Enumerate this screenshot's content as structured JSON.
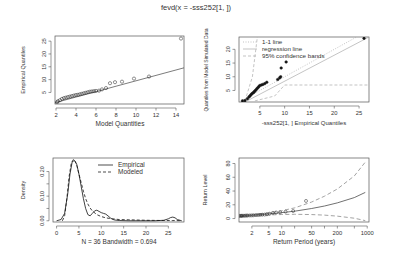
{
  "figure": {
    "title": "fevd(x = -sss252[1, ])",
    "width": 393,
    "height": 263
  },
  "chart_data": [
    {
      "id": "qq-model",
      "type": "scatter",
      "title": "",
      "xlabel": "Model Quantities",
      "ylabel": "Empirical Quantiles",
      "xlim": [
        1.9,
        14.8
      ],
      "ylim": [
        0.5,
        27
      ],
      "xticks": [
        2,
        4,
        6,
        8,
        10,
        12,
        14
      ],
      "yticks": [
        5,
        10,
        15,
        20,
        25
      ],
      "grid": false,
      "box": {
        "x0": 55,
        "y0": 36,
        "x1": 184,
        "y1": 104
      },
      "points": [
        [
          2.1,
          1.2
        ],
        [
          2.2,
          1.6
        ],
        [
          2.4,
          2.0
        ],
        [
          2.6,
          2.5
        ],
        [
          2.8,
          2.8
        ],
        [
          3.0,
          3.0
        ],
        [
          3.2,
          3.2
        ],
        [
          3.4,
          3.4
        ],
        [
          3.6,
          3.6
        ],
        [
          3.8,
          3.8
        ],
        [
          4.0,
          4.0
        ],
        [
          4.2,
          4.1
        ],
        [
          4.4,
          4.3
        ],
        [
          4.6,
          4.5
        ],
        [
          4.8,
          4.7
        ],
        [
          5.0,
          4.9
        ],
        [
          5.2,
          5.1
        ],
        [
          5.4,
          5.3
        ],
        [
          5.6,
          5.4
        ],
        [
          5.8,
          5.5
        ],
        [
          6.0,
          5.6
        ],
        [
          6.3,
          5.7
        ],
        [
          6.6,
          6.2
        ],
        [
          7.0,
          6.7
        ],
        [
          7.4,
          8.6
        ],
        [
          7.9,
          9.0
        ],
        [
          8.6,
          9.2
        ],
        [
          9.8,
          10.4
        ],
        [
          11.3,
          11.2
        ],
        [
          14.5,
          26.0
        ]
      ],
      "fit_line": {
        "x": [
          1.9,
          14.8
        ],
        "y": [
          1.0,
          14.6
        ]
      }
    },
    {
      "id": "qq-simulated",
      "type": "scatter",
      "xlabel": "-sss252[1, ] Empirical Quantiles",
      "ylabel": "Quantiles from Model Simulated Data",
      "xlim": [
        0.8,
        27
      ],
      "ylim": [
        0.8,
        24.5
      ],
      "xticks": [
        5,
        10,
        15,
        20,
        25
      ],
      "yticks": [
        5,
        10,
        15,
        20
      ],
      "grid": false,
      "box": {
        "x0": 239,
        "y0": 37,
        "x1": 369,
        "y1": 102
      },
      "legend": {
        "position": "topleft",
        "entries": [
          {
            "label": "1-1 line",
            "style": "dotted",
            "color": "#aaaaaa"
          },
          {
            "label": "regression line",
            "style": "solid",
            "color": "#aaaaaa"
          },
          {
            "label": "95% confidence bands",
            "style": "dashed",
            "color": "#aaaaaa"
          }
        ]
      },
      "points": [
        [
          1.5,
          1.2
        ],
        [
          2.0,
          1.3
        ],
        [
          2.5,
          2.0
        ],
        [
          2.8,
          2.6
        ],
        [
          3.0,
          3.0
        ],
        [
          3.2,
          3.4
        ],
        [
          3.4,
          3.8
        ],
        [
          3.6,
          4.1
        ],
        [
          3.8,
          4.4
        ],
        [
          4.0,
          4.8
        ],
        [
          4.2,
          5.2
        ],
        [
          4.4,
          5.6
        ],
        [
          4.6,
          6.0
        ],
        [
          4.8,
          6.4
        ],
        [
          5.0,
          6.8
        ],
        [
          5.3,
          7.0
        ],
        [
          5.6,
          7.2
        ],
        [
          6.0,
          7.5
        ],
        [
          6.4,
          8.0
        ],
        [
          8.6,
          9.0
        ],
        [
          9.0,
          9.6
        ],
        [
          9.2,
          10.0
        ],
        [
          9.3,
          13.2
        ],
        [
          10.3,
          15.4
        ],
        [
          26.0,
          24.0
        ]
      ],
      "one_to_one": {
        "x": [
          0.8,
          24.5
        ],
        "y": [
          0.8,
          24.5
        ]
      },
      "regression": {
        "x": [
          2.0,
          27
        ],
        "y": [
          0.8,
          24.5
        ]
      },
      "band_lower": {
        "x": [
          4.0,
          8.0,
          10.0,
          27
        ],
        "y": [
          1.2,
          3.0,
          7.0,
          7.0
        ]
      },
      "band_upper": {
        "x": [
          2.0,
          3.5,
          4.5
        ],
        "y": [
          1.2,
          10.0,
          24.5
        ]
      }
    },
    {
      "id": "density",
      "type": "line",
      "xlabel": "N = 36   Bandwidth = 0.694",
      "ylabel": "Density",
      "xlim": [
        -0.8,
        28.5
      ],
      "ylim": [
        -0.005,
        0.255
      ],
      "xticks": [
        0,
        5,
        10,
        15,
        20,
        25
      ],
      "yticks": [
        0.0,
        0.05,
        0.1,
        0.15,
        0.2
      ],
      "ytick_labels": [
        "0.00",
        "",
        "0.10",
        "",
        "0.20"
      ],
      "grid": false,
      "box": {
        "x0": 53,
        "y0": 158,
        "x1": 184,
        "y1": 222
      },
      "legend": {
        "position": "topright",
        "entries": [
          {
            "label": "Empirical",
            "style": "solid",
            "color": "#000000"
          },
          {
            "label": "Modeled",
            "style": "dashed",
            "color": "#000000"
          }
        ]
      },
      "series": [
        {
          "name": "Empirical",
          "style": "solid",
          "x": [
            0,
            1,
            1.8,
            2.5,
            3.0,
            3.5,
            4.0,
            4.5,
            5.0,
            5.5,
            6.0,
            6.5,
            7.0,
            7.5,
            8.0,
            8.5,
            9.0,
            9.5,
            10.0,
            10.5,
            11.0,
            11.5,
            12.0,
            12.5,
            13.0,
            14,
            16,
            18,
            20,
            22,
            24,
            25,
            25.5,
            26,
            26.5,
            27,
            28
          ],
          "y": [
            0.0,
            0.005,
            0.03,
            0.11,
            0.19,
            0.24,
            0.245,
            0.23,
            0.19,
            0.14,
            0.09,
            0.05,
            0.025,
            0.02,
            0.03,
            0.04,
            0.043,
            0.038,
            0.033,
            0.03,
            0.027,
            0.02,
            0.012,
            0.006,
            0.003,
            0.001,
            0.0,
            0.0,
            0.0,
            0.0,
            0.002,
            0.008,
            0.013,
            0.015,
            0.012,
            0.005,
            0.0
          ]
        },
        {
          "name": "Modeled",
          "style": "dashed",
          "x": [
            1.3,
            1.8,
            2.3,
            2.8,
            3.3,
            3.8,
            4.2,
            4.6,
            5.0,
            5.5,
            6.0,
            6.5,
            7.0,
            7.5,
            8.0,
            9.0,
            10.0,
            11.0,
            12.0,
            13.0,
            14.0,
            16.0,
            18.0,
            20.0,
            22.0,
            24.0,
            26.0,
            28.0
          ],
          "y": [
            0.0,
            0.02,
            0.09,
            0.18,
            0.235,
            0.25,
            0.24,
            0.22,
            0.19,
            0.155,
            0.12,
            0.09,
            0.068,
            0.052,
            0.04,
            0.025,
            0.017,
            0.012,
            0.009,
            0.007,
            0.005,
            0.004,
            0.003,
            0.002,
            0.0015,
            0.001,
            0.0008,
            0.0005
          ]
        }
      ]
    },
    {
      "id": "return-level",
      "type": "line",
      "xlabel": "Return Period (years)",
      "ylabel": "Return Level",
      "xscale": "log",
      "xlim": [
        1.0,
        1100
      ],
      "ylim": [
        -5,
        88
      ],
      "xticks": [
        2,
        5,
        10,
        20,
        50,
        100,
        200,
        500,
        1000
      ],
      "xtick_labels": [
        "2",
        "5",
        "10",
        "",
        "50",
        "",
        "200",
        "",
        "1000"
      ],
      "yticks": [
        0,
        20,
        40,
        60,
        80
      ],
      "grid": false,
      "box": {
        "x0": 239,
        "y0": 158,
        "x1": 369,
        "y1": 222
      },
      "series": [
        {
          "name": "Return level estimate",
          "style": "solid",
          "x": [
            1.05,
            1.5,
            2,
            3,
            5,
            10,
            20,
            50,
            100,
            200,
            500,
            900
          ],
          "y": [
            3.5,
            4.2,
            4.8,
            5.6,
            6.8,
            8.6,
            10.7,
            14.6,
            18.2,
            22.8,
            30.5,
            38.0
          ]
        },
        {
          "name": "Upper 95% CI",
          "style": "dashed",
          "x": [
            1.05,
            2,
            5,
            10,
            20,
            50,
            100,
            200,
            500,
            900
          ],
          "y": [
            4.0,
            5.5,
            8.2,
            11.4,
            15.5,
            24.0,
            32.5,
            43.0,
            62.0,
            82.0
          ]
        },
        {
          "name": "Lower 95% CI",
          "style": "dashed",
          "x": [
            1.05,
            2,
            5,
            10,
            20,
            50,
            100,
            200,
            500,
            900
          ],
          "y": [
            3.0,
            4.0,
            5.2,
            5.9,
            6.2,
            5.8,
            5.0,
            3.5,
            0.5,
            -3.0
          ]
        }
      ],
      "points": [
        [
          1.03,
          3.8
        ],
        [
          1.1,
          3.9
        ],
        [
          1.15,
          4.0
        ],
        [
          1.2,
          4.0
        ],
        [
          1.3,
          4.1
        ],
        [
          1.4,
          4.2
        ],
        [
          1.5,
          4.3
        ],
        [
          1.6,
          4.4
        ],
        [
          1.8,
          4.5
        ],
        [
          2.0,
          4.6
        ],
        [
          2.2,
          4.8
        ],
        [
          2.5,
          5.0
        ],
        [
          2.8,
          5.2
        ],
        [
          3.1,
          5.4
        ],
        [
          3.5,
          5.6
        ],
        [
          4.0,
          5.8
        ],
        [
          4.5,
          6.2
        ],
        [
          5.2,
          7.0
        ],
        [
          6.2,
          8.2
        ],
        [
          7.4,
          8.8
        ],
        [
          9.2,
          9.2
        ],
        [
          12.3,
          10.0
        ],
        [
          18.5,
          11.0
        ],
        [
          37,
          25.6
        ]
      ]
    }
  ]
}
